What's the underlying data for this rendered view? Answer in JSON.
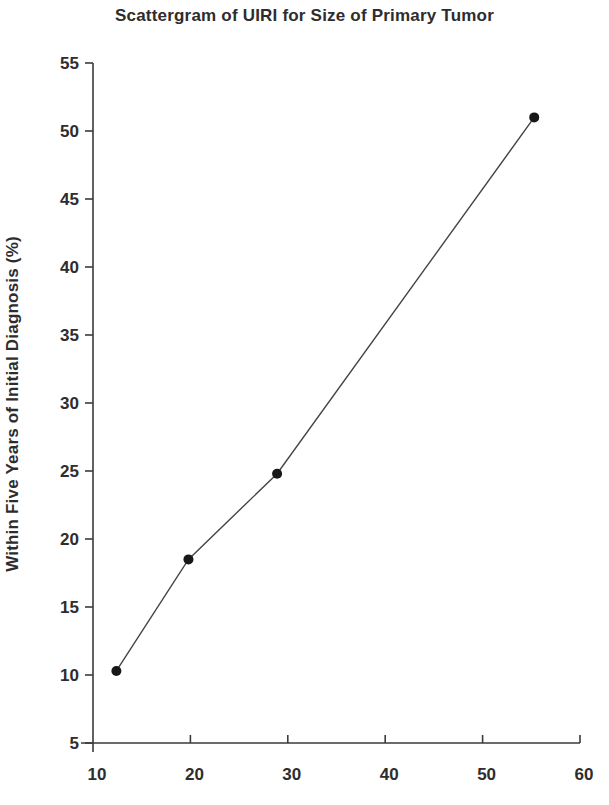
{
  "figure": {
    "kind": "scanned-book-scatter-figure",
    "background_color": "#ffffff",
    "text_color": "#2e2c2d",
    "axis_color": "#3a3a3a",
    "line_color": "#454545",
    "point_color": "#171717"
  },
  "chart_data": {
    "type": "scatter",
    "title": "Scattergram of UIRI for Size of Primary Tumor",
    "xlabel": "",
    "ylabel": "Within Five Years of Initial Diagnosis (%)",
    "xlim": [
      10,
      60
    ],
    "ylim": [
      5,
      55
    ],
    "x_ticks": [
      10,
      20,
      30,
      40,
      50,
      60
    ],
    "y_ticks": [
      5,
      10,
      15,
      20,
      25,
      30,
      35,
      40,
      45,
      50,
      55
    ],
    "grid": false,
    "legend_position": "none",
    "marker": "filled-circle",
    "points_connected_by_line": true,
    "points": [
      {
        "x": 12.4,
        "y": 10.3
      },
      {
        "x": 19.8,
        "y": 18.5
      },
      {
        "x": 28.9,
        "y": 24.8
      },
      {
        "x": 55.3,
        "y": 51.0
      }
    ]
  }
}
